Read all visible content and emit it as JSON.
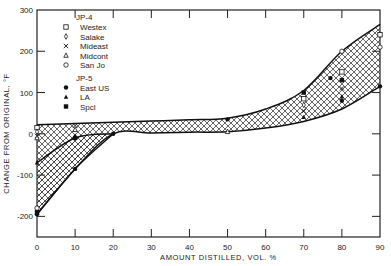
{
  "chart_data": {
    "type": "area",
    "title": "",
    "xlabel": "AMOUNT DISTILLED, VOL. %",
    "ylabel": "CHANGE FROM ORIGINAL, °F",
    "xlim": [
      0,
      90
    ],
    "ylim": [
      -250,
      300
    ],
    "x_ticks": [
      0,
      10,
      20,
      30,
      40,
      50,
      60,
      70,
      80,
      90
    ],
    "x_tick_labels": [
      "0",
      "10",
      "20",
      "30",
      "40",
      "50",
      "60",
      "70",
      "80",
      "90"
    ],
    "y_ticks": [
      -200,
      -100,
      0,
      100,
      200,
      300
    ],
    "y_tick_labels": [
      "-200",
      "-100",
      "0",
      "100",
      "200",
      "300"
    ],
    "grid": false,
    "legend_position": "top-left",
    "legend_groups": [
      {
        "title": "JP-4",
        "entries": [
          {
            "label": "Westex",
            "marker": "open-square"
          },
          {
            "label": "Salake",
            "marker": "open-diamond"
          },
          {
            "label": "Mideast",
            "marker": "x"
          },
          {
            "label": "Midcont",
            "marker": "open-triangle"
          },
          {
            "label": "San Jo",
            "marker": "open-circle"
          }
        ]
      },
      {
        "title": "JP-5",
        "entries": [
          {
            "label": "East US",
            "marker": "filled-circle"
          },
          {
            "label": "LA",
            "marker": "filled-triangle"
          },
          {
            "label": "Spcl",
            "marker": "filled-square"
          }
        ]
      }
    ],
    "bands": [
      {
        "name": "JP-4 envelope",
        "hatch": "cross",
        "x": [
          0,
          10,
          20,
          30,
          40,
          50,
          60,
          70,
          80,
          90
        ],
        "upper": [
          22,
          25,
          28,
          31,
          34,
          38,
          60,
          105,
          200,
          265
        ],
        "lower": [
          -195,
          -85,
          0,
          2,
          4,
          5,
          14,
          30,
          60,
          115
        ]
      },
      {
        "name": "JP-5 envelope",
        "hatch": "diagonal",
        "x": [
          0,
          10,
          20
        ],
        "upper": [
          -70,
          -10,
          0
        ],
        "lower": [
          -195,
          -85,
          0
        ]
      }
    ],
    "points": [
      {
        "series": "Westex",
        "x": 0,
        "y": 15
      },
      {
        "series": "Salake",
        "x": 0,
        "y": 5
      },
      {
        "series": "Mideast",
        "x": 0,
        "y": -5
      },
      {
        "series": "Midcont",
        "x": 0,
        "y": -10
      },
      {
        "series": "San Jo",
        "x": 0,
        "y": -180
      },
      {
        "series": "East US",
        "x": 0,
        "y": -195
      },
      {
        "series": "LA",
        "x": 0,
        "y": -70
      },
      {
        "series": "Spcl",
        "x": 0,
        "y": -190
      },
      {
        "series": "Mideast",
        "x": 10,
        "y": 20
      },
      {
        "series": "Midcont",
        "x": 10,
        "y": 10
      },
      {
        "series": "East US",
        "x": 10,
        "y": -85
      },
      {
        "series": "LA",
        "x": 10,
        "y": -5
      },
      {
        "series": "Spcl",
        "x": 10,
        "y": -10
      },
      {
        "series": "East US",
        "x": 20,
        "y": 0
      },
      {
        "series": "East US",
        "x": 50,
        "y": 35
      },
      {
        "series": "Midcont",
        "x": 50,
        "y": 5
      },
      {
        "series": "Spcl",
        "x": 70,
        "y": 100
      },
      {
        "series": "Westex",
        "x": 70,
        "y": 85
      },
      {
        "series": "Salake",
        "x": 70,
        "y": 70
      },
      {
        "series": "Mideast",
        "x": 70,
        "y": 55
      },
      {
        "series": "LA",
        "x": 70,
        "y": 40
      },
      {
        "series": "East US",
        "x": 77,
        "y": 135
      },
      {
        "series": "San Jo",
        "x": 80,
        "y": 200
      },
      {
        "series": "Westex",
        "x": 80,
        "y": 150
      },
      {
        "series": "Spcl",
        "x": 80,
        "y": 130
      },
      {
        "series": "Mideast",
        "x": 80,
        "y": 110
      },
      {
        "series": "LA",
        "x": 80,
        "y": 90
      },
      {
        "series": "East US",
        "x": 80,
        "y": 80
      },
      {
        "series": "Westex",
        "x": 90,
        "y": 240
      },
      {
        "series": "San Jo",
        "x": 90,
        "y": 210
      },
      {
        "series": "East US",
        "x": 90,
        "y": 115
      }
    ]
  }
}
